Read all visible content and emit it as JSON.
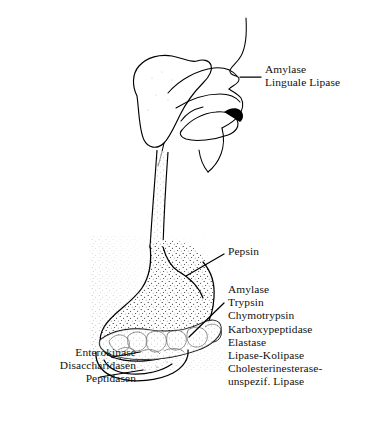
{
  "figure": {
    "background_color": "#ffffff",
    "ink_color": "#000000"
  },
  "labels": {
    "oral": {
      "name": "oral-enzymes-label",
      "lines": [
        "Amylase",
        "Linguale Lipase"
      ],
      "target": "mouth-salivary-region"
    },
    "stomach": {
      "name": "stomach-enzyme-label",
      "lines": [
        "Pepsin"
      ],
      "target": "stomach"
    },
    "pancreas": {
      "name": "pancreatic-enzymes-label",
      "lines": [
        "Amylase",
        "Trypsin",
        "Chymotrypsin",
        "Karboxypeptidase",
        "Elastase",
        "Lipase-Kolipase",
        "Cholesterinesterase-",
        "unspezif. Lipase"
      ],
      "target": "pancreas"
    },
    "intestine": {
      "name": "intestinal-enzymes-label",
      "lines": [
        "Enterokinase",
        "Disaccharidasen",
        "Peptidasen"
      ],
      "target": "duodenum"
    }
  },
  "anatomy": [
    {
      "name": "head-profile",
      "label": "Head sagittal profile"
    },
    {
      "name": "salivary-gland",
      "label": "Salivary gland"
    },
    {
      "name": "tongue",
      "label": "Tongue"
    },
    {
      "name": "soft-palate",
      "label": "Soft palate"
    },
    {
      "name": "esophagus",
      "label": "Esophagus"
    },
    {
      "name": "stomach",
      "label": "Stomach"
    },
    {
      "name": "pancreas",
      "label": "Pancreas"
    },
    {
      "name": "duodenum",
      "label": "Duodenum"
    }
  ]
}
